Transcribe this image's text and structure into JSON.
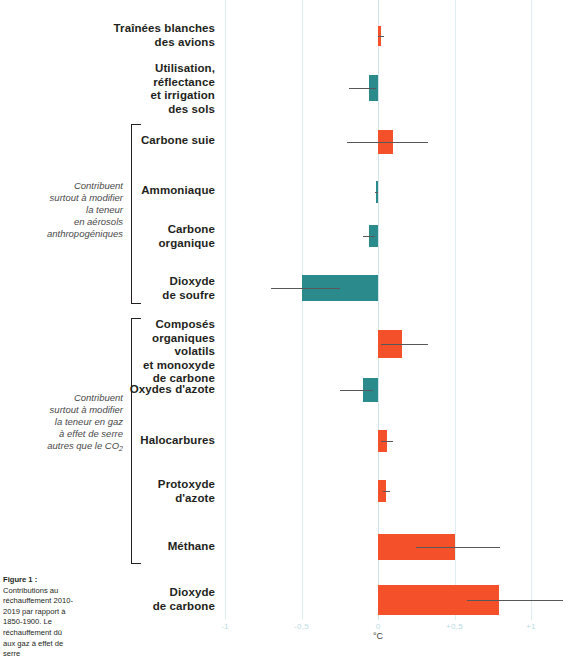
{
  "figure": {
    "caption_title": "Figure 1 :",
    "caption_body": "Contributions au réchauffement 2010-2019 par rapport à 1850-1900. Le réchauffement dû aux gaz à effet de serre",
    "axis_unit": "°C"
  },
  "groups": [
    {
      "id": "aerosols",
      "note_lines": [
        "Contribuent",
        "surtout à modifier",
        "la teneur",
        "en aérosols",
        "anthropogéniques"
      ]
    },
    {
      "id": "greenhouse",
      "note_lines": [
        "Contribuent",
        "surtout à modifier",
        "la teneur en gaz",
        "à effet de serre",
        "autres que le CO",
        "2"
      ]
    }
  ],
  "chart_data": {
    "type": "bar",
    "orientation": "horizontal",
    "title": "",
    "subtitle": "",
    "xlabel": "°C",
    "ylabel": "",
    "xlim": [
      -1.25,
      1.25
    ],
    "grid": true,
    "legend": false,
    "tick_values": [
      -1,
      -0.5,
      0,
      0.5,
      1
    ],
    "tick_labels": [
      "-1",
      "-0,5",
      "0",
      "+0,5",
      "+1"
    ],
    "colors": {
      "positive": "#f4502a",
      "negative": "#2a8a8c",
      "error": "#58585a",
      "grid": "#dfeef0"
    },
    "categories": [
      "Traînées blanches des avions",
      "Utilisation, réflectance et irrigation des sols",
      "Carbone suie",
      "Ammoniaque",
      "Carbone organique",
      "Dioxyde de soufre",
      "Composés organiques volatils et monoxyde de carbone",
      "Oxydes d'azote",
      "Halocarbures",
      "Protoxyde d'azote",
      "Méthane",
      "Dioxyde de carbone"
    ],
    "values": [
      0.02,
      -0.06,
      0.1,
      -0.01,
      -0.06,
      -0.5,
      0.16,
      -0.1,
      0.06,
      0.05,
      0.5,
      0.79
    ],
    "error_low": [
      0.0,
      -0.19,
      -0.2,
      -0.02,
      -0.1,
      -0.7,
      0.02,
      -0.25,
      0.02,
      0.03,
      0.25,
      0.58
    ],
    "error_high": [
      0.04,
      -0.01,
      0.33,
      0.0,
      -0.02,
      -0.25,
      0.33,
      -0.03,
      0.1,
      0.08,
      0.8,
      1.21
    ]
  },
  "rows": [
    {
      "label_lines": [
        "Traînées blanches",
        "des avions"
      ]
    },
    {
      "label_lines": [
        "Utilisation,",
        "réflectance",
        "et irrigation",
        "des sols"
      ]
    },
    {
      "label_lines": [
        "Carbone suie"
      ]
    },
    {
      "label_lines": [
        "Ammoniaque"
      ]
    },
    {
      "label_lines": [
        "Carbone",
        "organique"
      ]
    },
    {
      "label_lines": [
        "Dioxyde",
        "de soufre"
      ]
    },
    {
      "label_lines": [
        "Composés",
        "organiques",
        "volatils",
        "et monoxyde",
        "de carbone"
      ]
    },
    {
      "label_lines": [
        "Oxydes d'azote"
      ]
    },
    {
      "label_lines": [
        "Halocarbures"
      ]
    },
    {
      "label_lines": [
        "Protoxyde",
        "d'azote"
      ]
    },
    {
      "label_lines": [
        "Méthane"
      ]
    },
    {
      "label_lines": [
        "Dioxyde",
        "de carbone"
      ]
    }
  ]
}
